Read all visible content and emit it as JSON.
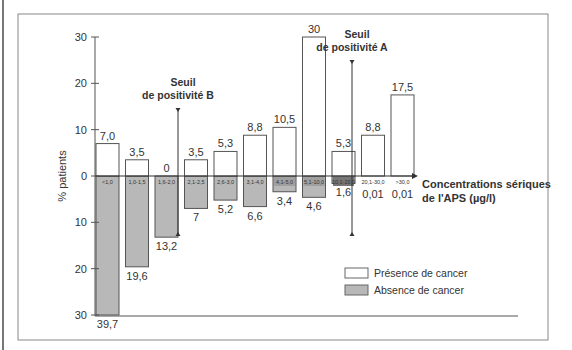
{
  "chart_data": {
    "type": "bar",
    "title": "",
    "xlabel": "Concentrations sériques de l'APS (µg/l)",
    "xlabel_lines": [
      "Concentrations sériques",
      "de l'APS (µg/l)"
    ],
    "ylabel": "% patients",
    "ylim": [
      -30,
      30
    ],
    "yticks": [
      {
        "value": 30,
        "label": "30"
      },
      {
        "value": 20,
        "label": "20"
      },
      {
        "value": 10,
        "label": "10"
      },
      {
        "value": 0,
        "label": "0"
      },
      {
        "value": -10,
        "label": "10"
      },
      {
        "value": -20,
        "label": "20"
      },
      {
        "value": -30,
        "label": "30"
      }
    ],
    "categories": [
      "<1,0",
      "1,0-1,5",
      "1,6-2,0",
      "2,1-2,5",
      "2,6-3,0",
      "3,1-4,0",
      "4,1-5,0",
      "5,1-10,0",
      "10,1-20,0",
      "20,1-30,0",
      ">30,0"
    ],
    "series": [
      {
        "name": "Présence de cancer",
        "color": "#ffffff",
        "direction": "up",
        "values": [
          7.0,
          3.5,
          0,
          3.5,
          5.3,
          8.8,
          10.5,
          30,
          5.3,
          8.8,
          17.5
        ],
        "labels": [
          "7,0",
          "3,5",
          "0",
          "3,5",
          "5,3",
          "8,8",
          "10,5",
          "30",
          "5,3",
          "8,8",
          "17,5"
        ]
      },
      {
        "name": "Absence de cancer",
        "color": "#b8b8b8",
        "direction": "down",
        "values": [
          39.7,
          19.6,
          13.2,
          7,
          5.2,
          6.6,
          3.4,
          4.6,
          1.6,
          0.01,
          0.01
        ],
        "labels": [
          "39,7",
          "19,6",
          "13,2",
          "7",
          "5,2",
          "6,6",
          "3,4",
          "4,6",
          "1,6",
          "0,01",
          "0,01"
        ]
      }
    ],
    "annotations": [
      {
        "name": "threshold-B",
        "lines": [
          "Seuil",
          "de positivité B"
        ],
        "between_categories": [
          "1,6-2,0",
          "2,1-2,5"
        ]
      },
      {
        "name": "threshold-A",
        "lines": [
          "Seuil",
          "de positivité A"
        ],
        "between_categories": [
          "10,1-20,0",
          "20,1-30,0"
        ]
      }
    ],
    "legend": {
      "position": "bottom-right",
      "entries": [
        {
          "label": "Présence de cancer",
          "color": "#ffffff"
        },
        {
          "label": "Absence de cancer",
          "color": "#b8b8b8"
        }
      ]
    },
    "grid": false
  }
}
